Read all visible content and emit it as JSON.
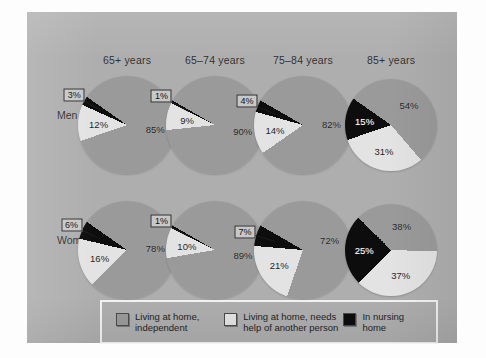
{
  "figure": {
    "panel_bg": "#aeaeae",
    "row_labels": [
      "Men",
      "Women"
    ],
    "column_headers": [
      "65+ years",
      "65–74 years",
      "75–84 years",
      "85+ years"
    ]
  },
  "colors": {
    "independent": "#9a9a9a",
    "needs_help": "#e3e3e3",
    "nursing_home": "#0d0d0d",
    "panel": "#aeaeae",
    "legend_border": "#f2f2f2"
  },
  "legend": {
    "items": [
      {
        "label": "Living at home, independent",
        "line1": "Living at home,",
        "line2": "independent",
        "color": "#9a9a9a",
        "swatch_name": "legend-swatch-independent"
      },
      {
        "label": "Living at home, needs help of another person",
        "line1": "Living at home, needs",
        "line2": "help of another person",
        "color": "#e3e3e3",
        "swatch_name": "legend-swatch-needs-help"
      },
      {
        "label": "In nursing home",
        "line1": "In nursing home",
        "line2": "",
        "color": "#0d0d0d",
        "swatch_name": "legend-swatch-nursing-home"
      }
    ]
  },
  "chart_data": {
    "type": "pie",
    "title": "",
    "xlabel": "",
    "ylabel": "",
    "categories": [
      "Living at home, independent",
      "Living at home, needs help of another person",
      "In nursing home"
    ],
    "groups": [
      "Men",
      "Women"
    ],
    "age_groups": [
      "65+ years",
      "65–74 years",
      "75–84 years",
      "85+ years"
    ],
    "units": "percent",
    "legend_position": "bottom",
    "charts": [
      {
        "group": "Men",
        "age_group": "65+ years",
        "values": [
          85,
          12,
          3
        ],
        "labels": [
          "85%",
          "12%",
          "3%"
        ],
        "callout_index": 2
      },
      {
        "group": "Men",
        "age_group": "65–74 years",
        "values": [
          90,
          9,
          1
        ],
        "labels": [
          "90%",
          "9%",
          "1%"
        ],
        "callout_index": 2
      },
      {
        "group": "Men",
        "age_group": "75–84 years",
        "values": [
          82,
          14,
          4
        ],
        "labels": [
          "82%",
          "14%",
          "4%"
        ],
        "callout_index": 2
      },
      {
        "group": "Men",
        "age_group": "85+ years",
        "values": [
          54,
          31,
          15
        ],
        "labels": [
          "54%",
          "31%",
          "15%"
        ],
        "callout_index": 2
      },
      {
        "group": "Women",
        "age_group": "65+ years",
        "values": [
          78,
          16,
          6
        ],
        "labels": [
          "78%",
          "16%",
          "6%"
        ],
        "callout_index": 2
      },
      {
        "group": "Women",
        "age_group": "65–74 years",
        "values": [
          89,
          10,
          1
        ],
        "labels": [
          "89%",
          "10%",
          "1%"
        ],
        "callout_index": 2
      },
      {
        "group": "Women",
        "age_group": "75–84 years",
        "values": [
          72,
          21,
          7
        ],
        "labels": [
          "72%",
          "21%",
          "7%"
        ],
        "callout_index": 2
      },
      {
        "group": "Women",
        "age_group": "85+ years",
        "values": [
          38,
          37,
          25
        ],
        "labels": [
          "38%",
          "37%",
          "25%"
        ],
        "callout_index": 2
      }
    ]
  }
}
